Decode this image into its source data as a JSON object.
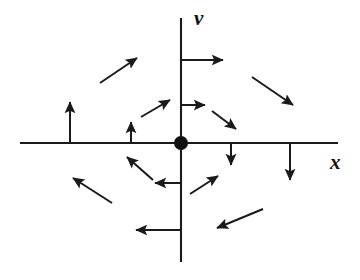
{
  "figure": {
    "type": "phase-portrait",
    "width": 360,
    "height": 280,
    "background_color": "#ffffff",
    "ink_color": "#1a1a1a"
  },
  "axes": {
    "horizontal": {
      "label": "x",
      "name": "x-axis",
      "y": 143,
      "x_start": 20,
      "x_end": 338,
      "label_x": 330,
      "label_y": 152
    },
    "vertical": {
      "label": "v",
      "name": "v-axis",
      "x": 181,
      "y_start": 18,
      "y_end": 262,
      "label_x": 194,
      "label_y": 8
    }
  },
  "origin": {
    "label": "equilibrium point",
    "x": 181,
    "y": 143,
    "radius": 7,
    "color": "#111111"
  },
  "chart_data": {
    "type": "scatter",
    "xlabel": "x",
    "ylabel": "v",
    "grid": false,
    "legend": null,
    "origin_marker": {
      "x": 0,
      "y": 0,
      "style": "filled-circle"
    },
    "arrows": [
      {
        "id": "a1",
        "name": "arrow-upper-axis-right",
        "x1": 181,
        "y1": 60,
        "x2": 223,
        "y2": 60,
        "direction": "right"
      },
      {
        "id": "a2",
        "name": "arrow-upper-left-diagonal",
        "x1": 100,
        "y1": 83,
        "x2": 137,
        "y2": 58,
        "direction": "up-right"
      },
      {
        "id": "a3",
        "name": "arrow-upper-right-diagonal",
        "x1": 252,
        "y1": 77,
        "x2": 293,
        "y2": 105,
        "direction": "down-right"
      },
      {
        "id": "a4",
        "name": "arrow-inner-upper-left-diagonal",
        "x1": 141,
        "y1": 117,
        "x2": 170,
        "y2": 100,
        "direction": "up-right"
      },
      {
        "id": "a5",
        "name": "arrow-inner-axis-right",
        "x1": 181,
        "y1": 105,
        "x2": 205,
        "y2": 105,
        "direction": "right"
      },
      {
        "id": "a6",
        "name": "arrow-inner-upper-right-diagonal",
        "x1": 212,
        "y1": 111,
        "x2": 236,
        "y2": 129,
        "direction": "down-right"
      },
      {
        "id": "a7",
        "name": "arrow-left-axis-up-long",
        "x1": 70,
        "y1": 143,
        "x2": 70,
        "y2": 102,
        "direction": "up"
      },
      {
        "id": "a8",
        "name": "arrow-left-axis-up-short",
        "x1": 131,
        "y1": 143,
        "x2": 131,
        "y2": 122,
        "direction": "up"
      },
      {
        "id": "a9",
        "name": "arrow-right-axis-down-short",
        "x1": 231,
        "y1": 143,
        "x2": 231,
        "y2": 165,
        "direction": "down"
      },
      {
        "id": "a10",
        "name": "arrow-right-axis-down-long",
        "x1": 290,
        "y1": 143,
        "x2": 290,
        "y2": 180,
        "direction": "down"
      },
      {
        "id": "a11",
        "name": "arrow-inner-lower-left-diagonal",
        "x1": 153,
        "y1": 180,
        "x2": 127,
        "y2": 157,
        "direction": "up-left"
      },
      {
        "id": "a12",
        "name": "arrow-inner-axis-left",
        "x1": 181,
        "y1": 183,
        "x2": 155,
        "y2": 183,
        "direction": "left"
      },
      {
        "id": "a13",
        "name": "arrow-inner-lower-right-diagonal",
        "x1": 190,
        "y1": 194,
        "x2": 218,
        "y2": 176,
        "direction": "up-right"
      },
      {
        "id": "a14",
        "name": "arrow-lower-left-diagonal",
        "x1": 112,
        "y1": 203,
        "x2": 73,
        "y2": 178,
        "direction": "up-left"
      },
      {
        "id": "a15",
        "name": "arrow-lower-axis-left",
        "x1": 181,
        "y1": 230,
        "x2": 136,
        "y2": 230,
        "direction": "left"
      },
      {
        "id": "a16",
        "name": "arrow-lower-right-diagonal",
        "x1": 263,
        "y1": 209,
        "x2": 217,
        "y2": 228,
        "direction": "down-left"
      }
    ]
  }
}
